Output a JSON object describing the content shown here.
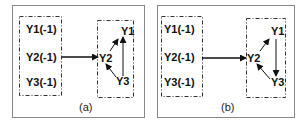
{
  "panels": [
    {
      "caption": "(a)",
      "inputs": [
        "Y1(-1)",
        "Y2(-1)",
        "Y3(-1)"
      ],
      "outputs": {
        "y1": "Y1",
        "y2": "Y2",
        "y3": "Y3"
      },
      "edges": [
        "inputs->Y2",
        "Y2->Y1",
        "Y3->Y2",
        "Y3->Y1"
      ]
    },
    {
      "caption": "(b)",
      "inputs": [
        "Y1(-1)",
        "Y2(-1)",
        "Y3(-1)"
      ],
      "outputs": {
        "y1": "Y1",
        "y2": "Y2",
        "y3": "Y3"
      },
      "edges": [
        "inputs->Y2",
        "Y2->Y1",
        "Y1->Y3",
        "Y3->Y2"
      ]
    }
  ],
  "colors": {
    "frame": "#888888",
    "line": "#111111"
  }
}
